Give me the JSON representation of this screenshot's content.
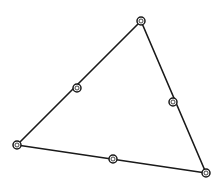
{
  "diagram": {
    "type": "triangle-with-midpoints",
    "stroke_color": "#1a1a1a",
    "background": "#ffffff",
    "vertices": [
      {
        "id": "A",
        "x": 141,
        "y": 21
      },
      {
        "id": "B",
        "x": 17,
        "y": 145
      },
      {
        "id": "C",
        "x": 206,
        "y": 173
      }
    ],
    "midpoints": [
      {
        "id": "AB",
        "x": 77,
        "y": 88
      },
      {
        "id": "AC",
        "x": 173,
        "y": 102
      },
      {
        "id": "BC",
        "x": 113,
        "y": 159
      }
    ],
    "edges": [
      {
        "from": "A",
        "to": "B"
      },
      {
        "from": "B",
        "to": "C"
      },
      {
        "from": "C",
        "to": "A"
      }
    ]
  }
}
